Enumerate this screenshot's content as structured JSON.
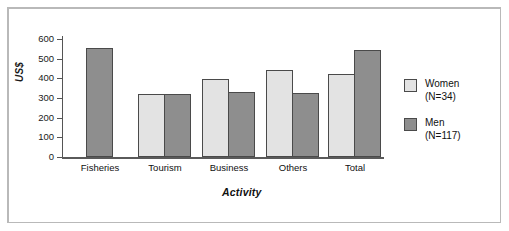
{
  "chart_data": {
    "type": "bar",
    "title": "",
    "xlabel": "Activity",
    "ylabel": "US$",
    "categories": [
      "Fisheries",
      "Tourism",
      "Business",
      "Others",
      "Total"
    ],
    "series": [
      {
        "name": "Women",
        "legend_label": "Women",
        "legend_sub": "(N=34)",
        "color": "#e3e3e3",
        "values": [
          null,
          322,
          395,
          440,
          420
        ]
      },
      {
        "name": "Men",
        "legend_label": "Men",
        "legend_sub": "(N=117)",
        "color": "#8e8e8e",
        "values": [
          553,
          318,
          330,
          325,
          545
        ]
      }
    ],
    "ylim": [
      0,
      600
    ],
    "yticks": [
      0,
      100,
      200,
      300,
      400,
      500,
      600
    ],
    "ytick_labels": [
      "0",
      "100",
      "200",
      "300",
      "400",
      "500",
      "600"
    ],
    "grid": false,
    "legend_position": "right"
  },
  "colors": {
    "women": "#e3e3e3",
    "men": "#8e8e8e",
    "axis": "#555555",
    "bar_edge": "#4a4a4a",
    "figure_border": "#b9b9b9"
  }
}
